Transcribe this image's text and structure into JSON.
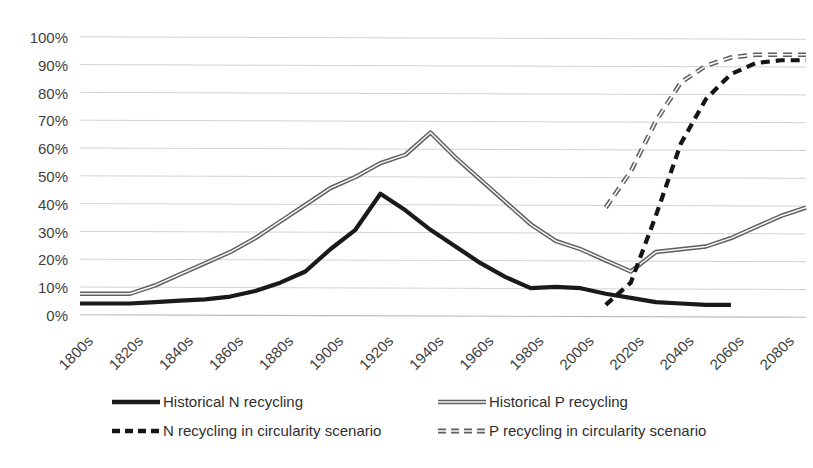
{
  "chart_data": {
    "type": "line",
    "title": "",
    "subtitle": "",
    "xlabel": "",
    "ylabel": "",
    "ylim": [
      0,
      100
    ],
    "ytick_labels": [
      "0%",
      "10%",
      "20%",
      "30%",
      "40%",
      "50%",
      "60%",
      "70%",
      "80%",
      "90%",
      "100%"
    ],
    "ytick_values": [
      0,
      10,
      20,
      30,
      40,
      50,
      60,
      70,
      80,
      90,
      100
    ],
    "grid": true,
    "legend_position": "bottom",
    "categories": [
      "1800s",
      "1810s",
      "1820s",
      "1830s",
      "1840s",
      "1850s",
      "1860s",
      "1870s",
      "1880s",
      "1890s",
      "1900s",
      "1910s",
      "1920s",
      "1930s",
      "1940s",
      "1950s",
      "1960s",
      "1970s",
      "1980s",
      "1990s",
      "2000s",
      "2010s",
      "2020s",
      "2030s",
      "2040s",
      "2050s",
      "2060s",
      "2070s",
      "2080s",
      "2090s"
    ],
    "tick_labels_shown": [
      "1800s",
      "1820s",
      "1840s",
      "1860s",
      "1880s",
      "1900s",
      "1920s",
      "1940s",
      "1960s",
      "1980s",
      "2000s",
      "2020s",
      "2040s",
      "2060s",
      "2080s"
    ],
    "series": [
      {
        "name": "Historical N recycling",
        "style": "solid",
        "color": "#1a1a1a",
        "values": [
          4.5,
          4.5,
          4.5,
          5,
          5.5,
          6,
          7,
          9,
          12,
          16,
          24,
          31,
          44,
          38,
          31,
          25,
          19,
          14,
          10,
          10.5,
          10,
          8,
          6.5,
          5,
          4.5,
          4,
          4,
          null,
          null,
          null
        ]
      },
      {
        "name": "Historical P recycling",
        "style": "solid-outlined",
        "color": "#5f5f5f",
        "values": [
          8,
          8,
          8,
          11,
          15,
          19,
          23,
          28,
          34,
          40,
          46,
          50,
          55,
          58,
          66,
          57,
          49,
          41,
          33,
          27,
          24,
          20,
          16,
          23,
          24,
          25,
          28,
          32,
          36,
          39
        ]
      },
      {
        "name": "N recycling in circularity scenario",
        "style": "dashed",
        "color": "#151515",
        "values": [
          null,
          null,
          null,
          null,
          null,
          null,
          null,
          null,
          null,
          null,
          null,
          null,
          null,
          null,
          null,
          null,
          null,
          null,
          null,
          null,
          null,
          4,
          12,
          36,
          62,
          78,
          87,
          91,
          92,
          92
        ]
      },
      {
        "name": "P recycling in circularity scenario",
        "style": "dashed-outlined",
        "color": "#5f5f5f",
        "values": [
          null,
          null,
          null,
          null,
          null,
          null,
          null,
          null,
          null,
          null,
          null,
          null,
          null,
          null,
          null,
          null,
          null,
          null,
          null,
          null,
          null,
          39,
          52,
          70,
          84,
          90,
          93,
          94,
          94,
          94
        ]
      }
    ],
    "annotations": []
  },
  "legend": {
    "entries": [
      {
        "label": "Historical N recycling",
        "swatch": "solid-black-line"
      },
      {
        "label": "Historical P recycling",
        "swatch": "solid-grey-outlined-line"
      },
      {
        "label": "N recycling in circularity scenario",
        "swatch": "dashed-black-line"
      },
      {
        "label": "P recycling in circularity scenario",
        "swatch": "dashed-grey-outlined-line"
      }
    ]
  }
}
